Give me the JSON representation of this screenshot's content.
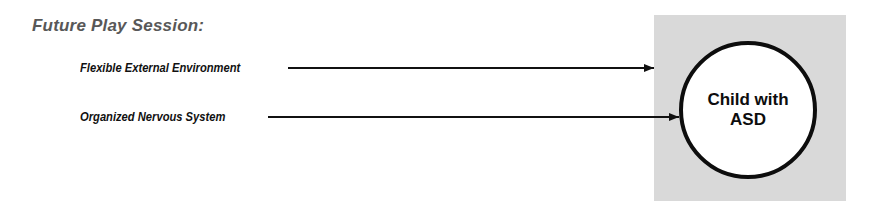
{
  "title": "Future Play Session:",
  "inputs": [
    {
      "label": "Flexible External Environment",
      "target": "environment-box"
    },
    {
      "label": "Organized Nervous System",
      "target": "child-circle"
    }
  ],
  "center_node": {
    "line1": "Child with",
    "line2": "ASD"
  },
  "colors": {
    "box_fill": "#d9d9d9",
    "circle_stroke": "#0d0d0d",
    "title": "#585858",
    "text": "#111111"
  }
}
